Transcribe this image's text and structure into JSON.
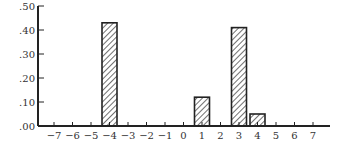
{
  "chart_data": {
    "type": "bar",
    "title": "",
    "xlabel": "",
    "ylabel": "",
    "x_ticks": [
      "−7",
      "−6",
      "−5",
      "−4",
      "−3",
      "−2",
      "−1",
      "0",
      "1",
      "2",
      "3",
      "4",
      "5",
      "6",
      "7"
    ],
    "x_values": [
      -7,
      -6,
      -5,
      -4,
      -3,
      -2,
      -1,
      0,
      1,
      2,
      3,
      4,
      5,
      6,
      7
    ],
    "y_ticks": [
      ".00",
      ".10",
      ".20",
      ".30",
      ".40",
      ".50"
    ],
    "y_tick_values": [
      0,
      0.1,
      0.2,
      0.3,
      0.4,
      0.5
    ],
    "ylim": [
      0,
      0.5
    ],
    "xlim": [
      -7.5,
      7.5
    ],
    "grid": false,
    "bar_fill": "diagonal-hatch",
    "bars": [
      {
        "x": -4,
        "value": 0.43
      },
      {
        "x": 1,
        "value": 0.12
      },
      {
        "x": 3,
        "value": 0.41
      },
      {
        "x": 4,
        "value": 0.05
      }
    ]
  }
}
